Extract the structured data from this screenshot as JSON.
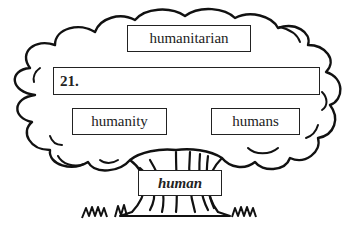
{
  "diagram": {
    "type": "word-family-tree",
    "top_word": "humanitarian",
    "answer_prompt": "21.",
    "answer_value": "",
    "branch_words": [
      "humanity",
      "humans"
    ],
    "root_word": "human"
  }
}
